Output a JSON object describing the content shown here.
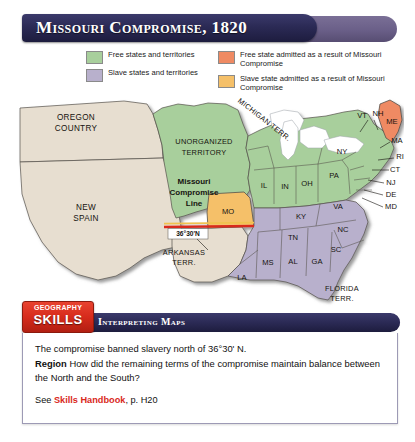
{
  "title": "Missouri Compromise, 1820",
  "legend": {
    "left": [
      {
        "label": "Free states and territories",
        "color": "#a8cf9c",
        "name": "free-states"
      },
      {
        "label": "Slave states and territories",
        "color": "#b8b0cc",
        "name": "slave-states"
      }
    ],
    "right": [
      {
        "label": "Free state admitted as a result of Missouri Compromise",
        "color": "#ef8a63",
        "name": "free-state-admitted"
      },
      {
        "label": "Slave state admitted as a result of Missouri Compromise",
        "color": "#f5c069",
        "name": "slave-state-admitted"
      }
    ]
  },
  "map": {
    "territories": [
      {
        "name": "oregon-country",
        "lines": [
          "OREGON",
          "COUNTRY"
        ],
        "x": 64,
        "y": 34,
        "fill": "#e7ded0"
      },
      {
        "name": "new-spain",
        "lines": [
          "NEW",
          "SPAIN"
        ],
        "x": 76,
        "y": 122,
        "fill": "#e7ded0"
      },
      {
        "name": "unorganized-territory",
        "lines": [
          "UNORGANIZED",
          "TERRITORY"
        ],
        "x": 197,
        "y": 56,
        "fill": "#a8cf9c"
      },
      {
        "name": "michigan-territory",
        "text": "MICHIGAN TERR.",
        "fill": "#a8cf9c"
      },
      {
        "name": "arkansas-territory",
        "lines": [
          "ARKANSAS",
          "TERR."
        ],
        "x": 172,
        "y": 167,
        "fill": "#e7ded0"
      },
      {
        "name": "florida-territory",
        "lines": [
          "FLORIDA",
          "TERR."
        ],
        "x": 330,
        "y": 203,
        "fill": "#b8b0cc"
      }
    ],
    "compromise_line_label": {
      "lines": [
        "Missouri",
        "Compromise",
        "Line"
      ],
      "x": 184,
      "y": 96
    },
    "latitude_label": "36°30'N",
    "free_states": [
      {
        "abbr": "IL",
        "x": 246,
        "y": 101
      },
      {
        "abbr": "IN",
        "x": 270,
        "y": 104
      },
      {
        "abbr": "OH",
        "x": 294,
        "y": 99
      },
      {
        "abbr": "PA",
        "x": 325,
        "y": 89
      },
      {
        "abbr": "NY",
        "x": 340,
        "y": 63
      },
      {
        "abbr": "VT",
        "x": 349,
        "y": 33
      },
      {
        "abbr": "NH",
        "x": 366,
        "y": 26
      },
      {
        "abbr": "MA",
        "x": 386,
        "y": 50
      },
      {
        "abbr": "RI",
        "x": 390,
        "y": 67
      },
      {
        "abbr": "CT",
        "x": 385,
        "y": 79
      },
      {
        "abbr": "NJ",
        "x": 380,
        "y": 92
      },
      {
        "abbr": "DE",
        "x": 379,
        "y": 104
      },
      {
        "abbr": "MD",
        "x": 379,
        "y": 116
      }
    ],
    "slave_states": [
      {
        "abbr": "VA",
        "x": 330,
        "y": 117
      },
      {
        "abbr": "KY",
        "x": 292,
        "y": 125
      },
      {
        "abbr": "TN",
        "x": 283,
        "y": 147
      },
      {
        "abbr": "NC",
        "x": 334,
        "y": 140
      },
      {
        "abbr": "SC",
        "x": 326,
        "y": 160
      },
      {
        "abbr": "GA",
        "x": 305,
        "y": 173
      },
      {
        "abbr": "AL",
        "x": 278,
        "y": 172
      },
      {
        "abbr": "MS",
        "x": 253,
        "y": 173
      },
      {
        "abbr": "LA",
        "x": 229,
        "y": 192
      }
    ],
    "admitted_free": [
      {
        "abbr": "ME",
        "x": 383,
        "y": 33
      }
    ],
    "admitted_slave": [
      {
        "abbr": "MO",
        "x": 216,
        "y": 123
      }
    ]
  },
  "skills": {
    "badge_line1": "GEOGRAPHY",
    "badge_line2": "SKILLS",
    "banner": "Interpreting Maps"
  },
  "question": {
    "statement": "The compromise banned slavery north of 36°30' N.",
    "prompt_label": "Region",
    "prompt": "How did the remaining terms of the compromise maintain balance between the North and the South?",
    "see_prefix": "See ",
    "see_link": "Skills Handbook",
    "see_suffix": ", p. H20"
  },
  "colors": {
    "free": "#a8cf9c",
    "slave": "#b8b0cc",
    "admitted_free": "#ef8a63",
    "admitted_slave": "#f5c069",
    "unclaimed": "#e7ded0",
    "line_red": "#d9291c",
    "navy": "#2b2a55",
    "purple": "#6a5f88"
  }
}
